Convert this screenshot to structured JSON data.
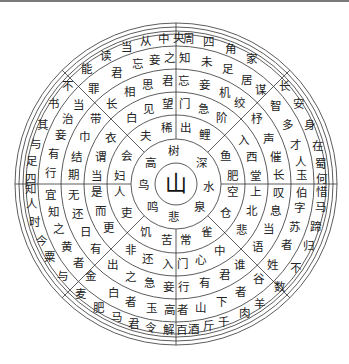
{
  "figure": {
    "center_char": "山",
    "stroke_color": "#333333",
    "text_color": "#222222",
    "center": [
      176,
      184
    ],
    "ring_radii": [
      21,
      45,
      69,
      92,
      115,
      138,
      150,
      153,
      157,
      161
    ],
    "radial_lines": [
      {
        "angle": -90,
        "r0": 115,
        "r1": 161
      },
      {
        "angle": 90,
        "r0": 115,
        "r1": 161
      },
      {
        "angle": 0,
        "r0": 115,
        "r1": 161
      },
      {
        "angle": 180,
        "r0": 115,
        "r1": 161
      },
      {
        "angle": -90,
        "r0": 45,
        "r1": 69
      },
      {
        "angle": 90,
        "r0": 45,
        "r1": 69
      },
      {
        "angle": 0,
        "r0": 45,
        "r1": 69
      },
      {
        "angle": 180,
        "r0": 45,
        "r1": 69
      },
      {
        "angle": -135,
        "r0": 45,
        "r1": 161
      },
      {
        "angle": -45,
        "r0": 45,
        "r1": 161
      },
      {
        "angle": 45,
        "r0": 45,
        "r1": 161
      },
      {
        "angle": 135,
        "r0": 45,
        "r1": 161
      },
      {
        "angle": -90,
        "r0": 69,
        "r1": 115
      },
      {
        "angle": 90,
        "r0": 69,
        "r1": 115
      },
      {
        "angle": 0,
        "r0": 69,
        "r1": 115
      },
      {
        "angle": 180,
        "r0": 69,
        "r1": 115
      }
    ],
    "rings": [
      {
        "name": "ring-1",
        "radius": 33,
        "chars": [
          {
            "c": "树",
            "a": -95
          },
          {
            "c": "深",
            "a": -40
          },
          {
            "c": "水",
            "a": 5
          },
          {
            "c": "泉",
            "a": 45
          },
          {
            "c": "悲",
            "a": 95
          },
          {
            "c": "鸣",
            "a": 135
          },
          {
            "c": "鸟",
            "a": 178
          },
          {
            "c": "高",
            "a": -140
          }
        ]
      },
      {
        "name": "ring-2",
        "radius": 57,
        "chars": [
          {
            "c": "出",
            "a": -80
          },
          {
            "c": "鲤",
            "a": -60
          },
          {
            "c": "鱼",
            "a": -30
          },
          {
            "c": "肥",
            "a": -8
          },
          {
            "c": "空",
            "a": 8
          },
          {
            "c": "仓",
            "a": 30
          },
          {
            "c": "雀",
            "a": 58
          },
          {
            "c": "常",
            "a": 80
          },
          {
            "c": "苦",
            "a": 100
          },
          {
            "c": "饥",
            "a": 122
          },
          {
            "c": "吏",
            "a": 150
          },
          {
            "c": "人",
            "a": 172
          },
          {
            "c": "妇",
            "a": -172
          },
          {
            "c": "会",
            "a": -150
          },
          {
            "c": "夫",
            "a": -122
          },
          {
            "c": "稀",
            "a": -100
          }
        ]
      },
      {
        "name": "ring-3",
        "radius": 80,
        "chars": [
          {
            "c": "门",
            "a": -84
          },
          {
            "c": "急",
            "a": -70
          },
          {
            "c": "阶",
            "a": -55
          },
          {
            "c": "入",
            "a": -33
          },
          {
            "c": "西",
            "a": -20
          },
          {
            "c": "堂",
            "a": -6
          },
          {
            "c": "上",
            "a": 6
          },
          {
            "c": "北",
            "a": 20
          },
          {
            "c": "悲",
            "a": 35
          },
          {
            "c": "中",
            "a": 57
          },
          {
            "c": "心",
            "a": 72
          },
          {
            "c": "门",
            "a": 85
          },
          {
            "c": "入",
            "a": 96
          },
          {
            "c": "还",
            "a": 111
          },
          {
            "c": "非",
            "a": 125
          },
          {
            "c": "更",
            "a": 147
          },
          {
            "c": "而",
            "a": 160
          },
          {
            "c": "是",
            "a": 174
          },
          {
            "c": "当",
            "a": -174
          },
          {
            "c": "谓",
            "a": -160
          },
          {
            "c": "衣",
            "a": -145
          },
          {
            "c": "白",
            "a": -124
          },
          {
            "c": "见",
            "a": -110
          },
          {
            "c": "望",
            "a": -96
          }
        ]
      },
      {
        "name": "ring-4",
        "radius": 103,
        "chars": [
          {
            "c": "忘",
            "a": -86
          },
          {
            "c": "妾",
            "a": -74
          },
          {
            "c": "机",
            "a": -62
          },
          {
            "c": "绞",
            "a": -52
          },
          {
            "c": "杼",
            "a": -39
          },
          {
            "c": "声",
            "a": -26
          },
          {
            "c": "催",
            "a": -15
          },
          {
            "c": "长",
            "a": -5
          },
          {
            "c": "叹",
            "a": 5
          },
          {
            "c": "息",
            "a": 15
          },
          {
            "c": "当",
            "a": 26
          },
          {
            "c": "语",
            "a": 38
          },
          {
            "c": "谁",
            "a": 52
          },
          {
            "c": "君",
            "a": 62
          },
          {
            "c": "有",
            "a": 74
          },
          {
            "c": "行",
            "a": 86
          },
          {
            "c": "妾",
            "a": 94
          },
          {
            "c": "急",
            "a": 105
          },
          {
            "c": "之",
            "a": 116
          },
          {
            "c": "出",
            "a": 128
          },
          {
            "c": "有",
            "a": 141
          },
          {
            "c": "日",
            "a": 152
          },
          {
            "c": "还",
            "a": 163
          },
          {
            "c": "无",
            "a": 174
          },
          {
            "c": "期",
            "a": -175
          },
          {
            "c": "结",
            "a": -165
          },
          {
            "c": "巾",
            "a": -153
          },
          {
            "c": "带",
            "a": -141
          },
          {
            "c": "长",
            "a": -129
          },
          {
            "c": "相",
            "a": -117
          },
          {
            "c": "思",
            "a": -106
          },
          {
            "c": "君",
            "a": -95
          }
        ]
      },
      {
        "name": "ring-5",
        "radius": 126,
        "chars": [
          {
            "c": "知",
            "a": -86
          },
          {
            "c": "未",
            "a": -76
          },
          {
            "c": "足",
            "a": -66
          },
          {
            "c": "居",
            "a": -56
          },
          {
            "c": "谋",
            "a": -48
          },
          {
            "c": "智",
            "a": -38
          },
          {
            "c": "多",
            "a": -28
          },
          {
            "c": "才",
            "a": -18
          },
          {
            "c": "人",
            "a": -10
          },
          {
            "c": "玉",
            "a": -4
          },
          {
            "c": "伯",
            "a": 4
          },
          {
            "c": "字",
            "a": 11
          },
          {
            "c": "苏",
            "a": 20
          },
          {
            "c": "者",
            "a": 29
          },
          {
            "c": "姓",
            "a": 40
          },
          {
            "c": "谷",
            "a": 49
          },
          {
            "c": "者",
            "a": 59
          },
          {
            "c": "下",
            "a": 69
          },
          {
            "c": "山",
            "a": 79
          },
          {
            "c": "者",
            "a": 87
          },
          {
            "c": "高",
            "a": 93
          },
          {
            "c": "玉",
            "a": 101
          },
          {
            "c": "者",
            "a": 111
          },
          {
            "c": "白",
            "a": 120
          },
          {
            "c": "金",
            "a": 133
          },
          {
            "c": "者",
            "a": 141
          },
          {
            "c": "黄",
            "a": 150
          },
          {
            "c": "之",
            "a": 159
          },
          {
            "c": "知",
            "a": 167
          },
          {
            "c": "宜",
            "a": 175
          },
          {
            "c": "行",
            "a": -175
          },
          {
            "c": "有",
            "a": -166
          },
          {
            "c": "妾",
            "a": -157
          },
          {
            "c": "治",
            "a": -149
          },
          {
            "c": "当",
            "a": -141
          },
          {
            "c": "罪",
            "a": -131
          },
          {
            "c": "君",
            "a": -118
          },
          {
            "c": "忘",
            "a": -108
          },
          {
            "c": "妾",
            "a": -100
          },
          {
            "c": "之",
            "a": -93
          }
        ]
      },
      {
        "name": "ring-6",
        "radius": 146,
        "chars": [
          {
            "c": "周",
            "a": -85
          },
          {
            "c": "四",
            "a": -77
          },
          {
            "c": "角",
            "a": -68
          },
          {
            "c": "家",
            "a": -59
          },
          {
            "c": "长",
            "a": -42
          },
          {
            "c": "安",
            "a": -33
          },
          {
            "c": "身",
            "a": -24
          },
          {
            "c": "在",
            "a": -15
          },
          {
            "c": "蜀",
            "a": -8
          },
          {
            "c": "何",
            "a": -2
          },
          {
            "c": "惜",
            "a": 3
          },
          {
            "c": "马",
            "a": 9
          },
          {
            "c": "蹄",
            "a": 17
          },
          {
            "c": "归",
            "a": 25
          },
          {
            "c": "不",
            "a": 35
          },
          {
            "c": "数",
            "a": 45
          },
          {
            "c": "羊",
            "a": 55
          },
          {
            "c": "肉",
            "a": 62
          },
          {
            "c": "千",
            "a": 71
          },
          {
            "c": "斤",
            "a": 77
          },
          {
            "c": "酒",
            "a": 83
          },
          {
            "c": "百",
            "a": 88
          },
          {
            "c": "解",
            "a": 93
          },
          {
            "c": "令",
            "a": 100
          },
          {
            "c": "君",
            "a": 107
          },
          {
            "c": "马",
            "a": 114
          },
          {
            "c": "肥",
            "a": 122
          },
          {
            "c": "麦",
            "a": 131
          },
          {
            "c": "与",
            "a": 141
          },
          {
            "c": "粟",
            "a": 150
          },
          {
            "c": "今",
            "a": 157
          },
          {
            "c": "时",
            "a": 165
          },
          {
            "c": "人",
            "a": 172
          },
          {
            "c": "知",
            "a": 178
          },
          {
            "c": "四",
            "a": -178
          },
          {
            "c": "足",
            "a": -171
          },
          {
            "c": "与",
            "a": -164
          },
          {
            "c": "其",
            "a": -156
          },
          {
            "c": "书",
            "a": -147
          },
          {
            "c": "不",
            "a": -138
          },
          {
            "c": "能",
            "a": -128
          },
          {
            "c": "读",
            "a": -119
          },
          {
            "c": "当",
            "a": -110
          },
          {
            "c": "从",
            "a": -102
          },
          {
            "c": "中",
            "a": -95
          },
          {
            "c": "央",
            "a": -89
          }
        ]
      }
    ]
  }
}
